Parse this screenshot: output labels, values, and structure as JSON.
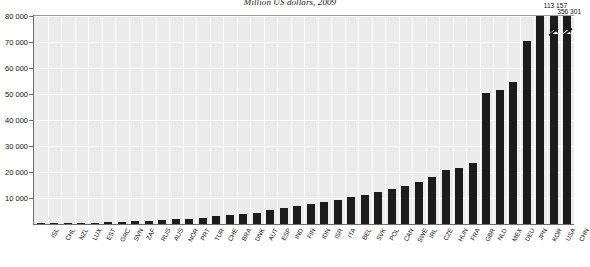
{
  "chart_data": {
    "type": "bar",
    "title": "Million US dollars, 2009",
    "xlabel": "",
    "ylabel": "",
    "ylim": [
      0,
      80000
    ],
    "ytick_labels": [
      "80 000",
      "70 000",
      "60 000",
      "50 000",
      "40 000",
      "30 000",
      "20 000",
      "10 000"
    ],
    "ytick_values": [
      80000,
      70000,
      60000,
      50000,
      40000,
      30000,
      20000,
      10000
    ],
    "grid": true,
    "legend": "none",
    "categories": [
      "ISL",
      "CHL",
      "NZL",
      "LUX",
      "EST",
      "GRC",
      "SVN",
      "ZAF",
      "RUS",
      "AUS",
      "NOR",
      "PRT",
      "TUR",
      "CHE",
      "BRA",
      "DNK",
      "AUT",
      "ESP",
      "IND",
      "FIN",
      "IDN",
      "ISR",
      "ITA",
      "BEL",
      "SVK",
      "POL",
      "CAN",
      "SWE",
      "IRL",
      "CZE",
      "HUN",
      "FRA",
      "GBR",
      "NLD",
      "MEX",
      "DEU",
      "JPN",
      "KOR",
      "USA",
      "CHN"
    ],
    "values": [
      120,
      200,
      320,
      420,
      520,
      700,
      850,
      1000,
      1200,
      1500,
      1800,
      2100,
      2500,
      2900,
      3300,
      3800,
      4400,
      5200,
      6000,
      6800,
      7600,
      8400,
      9300,
      10200,
      11200,
      12200,
      13300,
      14500,
      16000,
      18000,
      20600,
      21500,
      23400,
      50500,
      51500,
      54500,
      70500,
      80000,
      80000,
      80000
    ],
    "truncated_bars": [
      {
        "category": "USA",
        "label": "113 157",
        "value": 113157
      },
      {
        "category": "CHN",
        "label": "356 301",
        "value": 356301
      }
    ]
  }
}
